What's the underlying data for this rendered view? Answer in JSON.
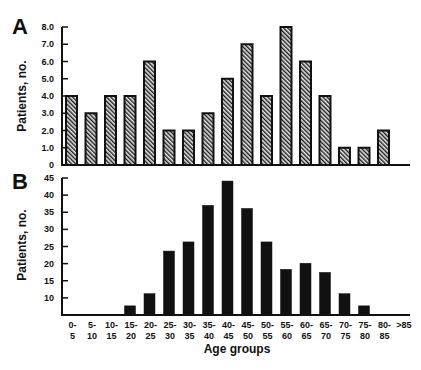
{
  "chart_data": [
    {
      "panel": "A",
      "type": "bar",
      "title": "",
      "xlabel": "",
      "ylabel": "Patients, no.",
      "ylim": [
        0,
        8
      ],
      "yticks": [
        "0",
        "1.0",
        "2.0",
        "3.0",
        "4.0",
        "5.0",
        "6.0",
        "7.0",
        "8.0"
      ],
      "bar_style": "hatched",
      "grid": false,
      "categories": [
        "0-5",
        "5-10",
        "10-15",
        "15-20",
        "20-25",
        "25-30",
        "30-35",
        "35-40",
        "40-45",
        "45-50",
        "50-55",
        "55-60",
        "60-65",
        "65-70",
        "70-75",
        "75-80",
        "80-85",
        ">85"
      ],
      "values": [
        4,
        3,
        4,
        4,
        6,
        2,
        2,
        3,
        5,
        7,
        4,
        8,
        6,
        4,
        1,
        1,
        2,
        0
      ]
    },
    {
      "panel": "B",
      "type": "bar",
      "title": "",
      "xlabel": "Age groups",
      "ylabel": "Patients, no.",
      "ylim": [
        0,
        45
      ],
      "yticks": [
        "",
        "10",
        "15",
        "20",
        "25",
        "30",
        "35",
        "40",
        "45"
      ],
      "bar_style": "solid",
      "grid": false,
      "categories": [
        "0-5",
        "5-10",
        "10-15",
        "15-20",
        "20-25",
        "25-30",
        "30-35",
        "35-40",
        "40-45",
        "45-50",
        "50-55",
        "55-60",
        "60-65",
        "65-70",
        "70-75",
        "75-80",
        "80-85",
        ">85"
      ],
      "values": [
        0,
        0,
        0,
        3,
        7,
        21,
        24,
        36,
        44,
        35,
        24,
        15,
        17,
        14,
        7,
        3,
        0,
        0
      ]
    }
  ],
  "labels": {
    "panel_a": "A",
    "panel_b": "B",
    "ylabel": "Patients, no.",
    "xlabel": "Age groups"
  },
  "x_tick_labels": [
    [
      "0-",
      "5"
    ],
    [
      "5-",
      "10"
    ],
    [
      "10-",
      "15"
    ],
    [
      "15-",
      "20"
    ],
    [
      "20-",
      "25"
    ],
    [
      "25-",
      "30"
    ],
    [
      "30-",
      "35"
    ],
    [
      "35-",
      "40"
    ],
    [
      "40-",
      "45"
    ],
    [
      "45-",
      "50"
    ],
    [
      "50-",
      "55"
    ],
    [
      "55-",
      "60"
    ],
    [
      "60-",
      "65"
    ],
    [
      "65-",
      "70"
    ],
    [
      "70-",
      "75"
    ],
    [
      "75-",
      "80"
    ],
    [
      "80-",
      "85"
    ],
    [
      ">85",
      ""
    ]
  ],
  "colors": {
    "ink": "#111111",
    "hatch_bg": "#d8d8d8"
  }
}
